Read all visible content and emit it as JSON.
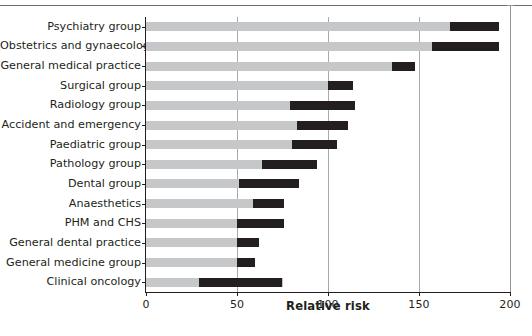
{
  "figure": {
    "background": "#ffffff",
    "bar_color_total": "#c6c7c9",
    "bar_color_highlight": "#231f20",
    "axis_color": "#231f20",
    "grid_color": "#a7a9ac"
  },
  "chart_data": {
    "type": "bar",
    "orientation": "horizontal",
    "title": "",
    "xlabel": "Relative risk",
    "ylabel": "",
    "xlim": [
      0,
      200
    ],
    "xticks": [
      0,
      50,
      100,
      150,
      200
    ],
    "xticklabels": [
      "0",
      "50",
      "100",
      "150",
      "200"
    ],
    "grid": "vertical",
    "legend": "none",
    "categories": [
      "Psychiatry group",
      "Obstetrics and gynaecology",
      "General medical practice",
      "Surgical group",
      "Radiology group",
      "Accident and emergency",
      "Paediatric group",
      "Pathology group",
      "Dental group",
      "Anaesthetics",
      "PHM and CHS",
      "General dental practice",
      "General medicine group",
      "Clinical oncology"
    ],
    "series": [
      {
        "name": "Relative risk (total)",
        "color": "#c6c7c9",
        "values": [
          194,
          194,
          148,
          114,
          115,
          111,
          105,
          94,
          84,
          76,
          76,
          62,
          60,
          75
        ]
      },
      {
        "name": "Highlighted interval",
        "color": "#231f20",
        "starts": [
          167,
          157,
          135,
          100,
          79,
          83,
          80,
          64,
          51,
          59,
          50,
          50,
          50,
          29
        ],
        "ends": [
          194,
          194,
          148,
          114,
          115,
          111,
          105,
          94,
          84,
          76,
          76,
          62,
          60,
          75
        ]
      }
    ]
  }
}
